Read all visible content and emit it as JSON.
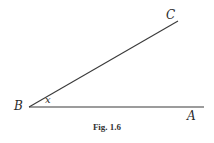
{
  "figure": {
    "caption": "Fig. 1.6",
    "line_color": "#3a3a3a",
    "points": {
      "B": {
        "label": "B",
        "x": 29,
        "y": 107
      },
      "A": {
        "label": "A",
        "x": 204,
        "y": 107
      },
      "C": {
        "label": "C",
        "x": 178,
        "y": 21
      }
    },
    "angle_label": "x"
  }
}
